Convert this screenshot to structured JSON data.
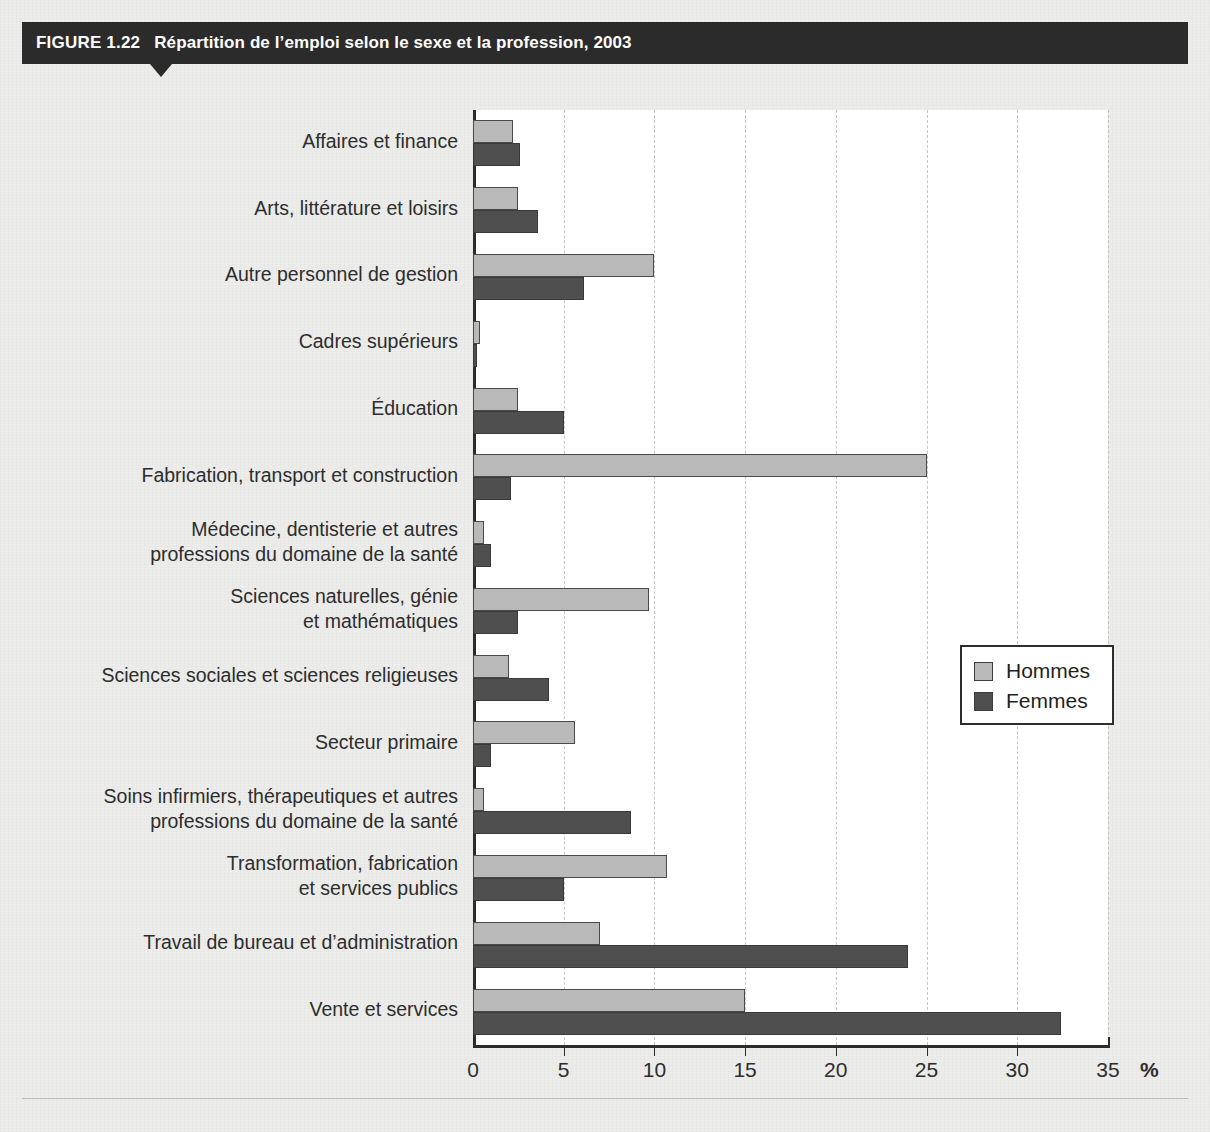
{
  "figure": {
    "number_label": "FIGURE 1.22",
    "title": "Répartition de l’emploi selon le sexe et la profession, 2003"
  },
  "legend": {
    "position": "right-middle",
    "entries": [
      {
        "label": "Hommes",
        "color": "#b9b9b9"
      },
      {
        "label": "Femmes",
        "color": "#4f4f4f"
      }
    ]
  },
  "axis": {
    "unit_label": "%",
    "ticks": [
      "0",
      "5",
      "10",
      "15",
      "20",
      "25",
      "30",
      "35"
    ]
  },
  "chart_data": {
    "type": "bar",
    "orientation": "horizontal",
    "title": "Répartition de l’emploi selon le sexe et la profession, 2003",
    "xlabel": "%",
    "ylabel": "",
    "xlim": [
      0,
      35
    ],
    "xticks": [
      0,
      5,
      10,
      15,
      20,
      25,
      30,
      35
    ],
    "grid": "vertical-dashed",
    "legend_position": "right-middle",
    "categories": [
      "Affaires et finance",
      "Arts, littérature et loisirs",
      "Autre personnel de gestion",
      "Cadres supérieurs",
      "Éducation",
      "Fabrication, transport et construction",
      "Médecine, dentisterie et autres\nprofessions du domaine de la santé",
      "Sciences naturelles, génie\net mathématiques",
      "Sciences sociales et sciences religieuses",
      "Secteur primaire",
      "Soins infirmiers, thérapeutiques et autres\nprofessions du domaine de la santé",
      "Transformation, fabrication\net services publics",
      "Travail de bureau et d’administration",
      "Vente et services"
    ],
    "series": [
      {
        "name": "Hommes",
        "color": "#b9b9b9",
        "values": [
          2.2,
          2.5,
          10.0,
          0.4,
          2.5,
          25.0,
          0.6,
          9.7,
          2.0,
          5.6,
          0.6,
          10.7,
          7.0,
          15.0
        ]
      },
      {
        "name": "Femmes",
        "color": "#4f4f4f",
        "values": [
          2.6,
          3.6,
          6.1,
          0.2,
          5.0,
          2.1,
          1.0,
          2.5,
          4.2,
          1.0,
          8.7,
          5.0,
          24.0,
          32.4
        ]
      }
    ]
  }
}
